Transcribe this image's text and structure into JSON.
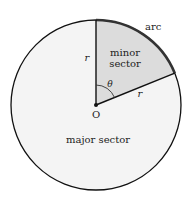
{
  "diagram": {
    "type": "circle-sector",
    "labels": {
      "arc": "arc",
      "minor_line1": "minor",
      "minor_line2": "sector",
      "major": "major sector",
      "center": "O",
      "radius_vertical": "r",
      "radius_slanted": "r",
      "angle": "θ"
    },
    "colors": {
      "circle_fill": "#f4f4f4",
      "minor_fill": "#dcdcdc",
      "stroke": "#111111",
      "arc_stroke": "#333333"
    },
    "geometry": {
      "center": [
        96,
        105
      ],
      "radius": 85,
      "sector_angle_deg": 68
    }
  }
}
